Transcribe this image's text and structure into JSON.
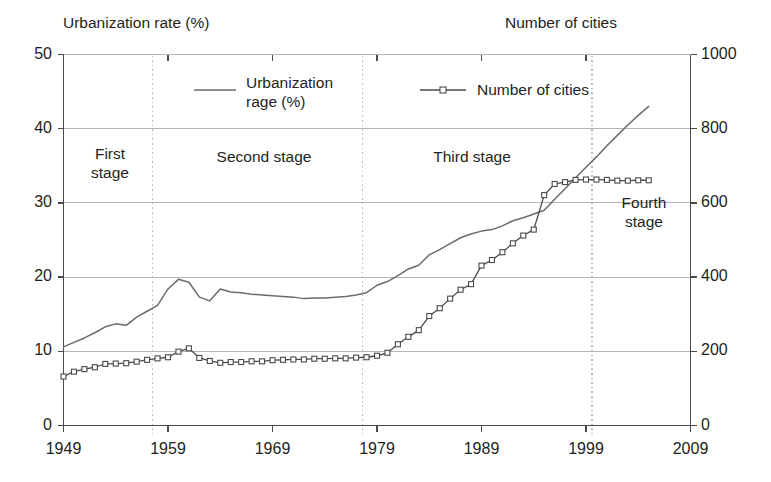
{
  "axes": {
    "left_title": "Urbanization rate (%)",
    "right_title": "Number of cities",
    "left_ticks": [
      "50",
      "40",
      "30",
      "20",
      "10",
      "0"
    ],
    "right_ticks": [
      "1000",
      "800",
      "600",
      "400",
      "200",
      "0"
    ],
    "x_ticks": [
      "1949",
      "1959",
      "1969",
      "1979",
      "1989",
      "1999",
      "2009"
    ]
  },
  "legend": {
    "series1_label": "Urbanization\nrage (%)",
    "series2_label": "Number of cities"
  },
  "stages": [
    {
      "label": "First\nstage"
    },
    {
      "label": "Second stage"
    },
    {
      "label": "Third stage"
    },
    {
      "label": "Fourth\nstage"
    }
  ],
  "chart_data": {
    "type": "line",
    "title": "",
    "xlabel": "",
    "ylabel": "Urbanization rate (%)",
    "y2label": "Number of cities",
    "xlim": [
      1949,
      2009
    ],
    "ylim": [
      0,
      50
    ],
    "y2lim": [
      0,
      1000
    ],
    "grid": true,
    "grid_axis": "y",
    "legend_position": "top-inside",
    "colors": {
      "urbanization_line": "#6b6b6b",
      "cities_line": "#4a4a4a",
      "marker_fill": "#ffffff",
      "grid": "#b5b5b5",
      "axis": "#4a4a4a",
      "divider": "#bdbdbd",
      "text": "#231f20"
    },
    "stage_dividers_x": [
      1957.5,
      1977.6,
      1999.6
    ],
    "stage_bands": [
      {
        "name": "First stage",
        "from": 1949,
        "to": 1957.5
      },
      {
        "name": "Second stage",
        "from": 1957.5,
        "to": 1977.6
      },
      {
        "name": "Third stage",
        "from": 1977.6,
        "to": 1999.6
      },
      {
        "name": "Fourth stage",
        "from": 1999.6,
        "to": 2009
      }
    ],
    "x": [
      1949,
      1950,
      1951,
      1952,
      1953,
      1954,
      1955,
      1956,
      1957,
      1958,
      1959,
      1960,
      1961,
      1962,
      1963,
      1964,
      1965,
      1966,
      1967,
      1968,
      1969,
      1970,
      1971,
      1972,
      1973,
      1974,
      1975,
      1976,
      1977,
      1978,
      1979,
      1980,
      1981,
      1982,
      1983,
      1984,
      1985,
      1986,
      1987,
      1988,
      1989,
      1990,
      1991,
      1992,
      1993,
      1994,
      1995,
      1996,
      1997,
      1998,
      1999,
      2000,
      2001,
      2002,
      2003,
      2004,
      2005
    ],
    "series": [
      {
        "name": "Urbanization rage (%)",
        "axis": "left",
        "unit": "%",
        "marker": "none",
        "values": [
          10.6,
          11.2,
          11.8,
          12.5,
          13.3,
          13.7,
          13.5,
          14.6,
          15.4,
          16.2,
          18.4,
          19.7,
          19.3,
          17.3,
          16.8,
          18.4,
          18.0,
          17.9,
          17.7,
          17.6,
          17.5,
          17.4,
          17.3,
          17.1,
          17.2,
          17.2,
          17.3,
          17.4,
          17.6,
          17.9,
          18.9,
          19.4,
          20.2,
          21.1,
          21.6,
          23.0,
          23.7,
          24.5,
          25.3,
          25.8,
          26.2,
          26.4,
          26.9,
          27.6,
          28.0,
          28.5,
          29.0,
          30.5,
          31.9,
          33.4,
          34.8,
          36.2,
          37.7,
          39.1,
          40.5,
          41.8,
          43.0
        ]
      },
      {
        "name": "Number of cities",
        "axis": "right",
        "unit": "cities",
        "marker": "square-open",
        "values": [
          132,
          145,
          152,
          157,
          166,
          167,
          168,
          172,
          177,
          181,
          184,
          199,
          208,
          182,
          174,
          169,
          171,
          171,
          173,
          173,
          176,
          177,
          178,
          178,
          180,
          180,
          181,
          181,
          183,
          184,
          188,
          196,
          219,
          239,
          257,
          295,
          316,
          342,
          366,
          381,
          431,
          446,
          467,
          491,
          512,
          528,
          621,
          651,
          656,
          662,
          663,
          663,
          662,
          660,
          660,
          661,
          661
        ]
      }
    ]
  }
}
